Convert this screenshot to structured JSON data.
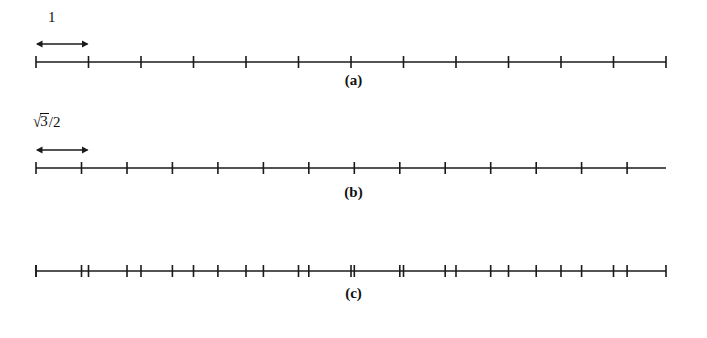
{
  "figure": {
    "background_color": "#ffffff",
    "ink_color": "#1a1a1a",
    "width": 707,
    "height": 338
  },
  "chart_data": {
    "type": "line",
    "title": "",
    "subtitle": "",
    "xlabel": "",
    "ylabel": "",
    "legend_position": "none",
    "grid": false,
    "panels": [
      {
        "caption": "(a)",
        "caption_x": 355,
        "caption_y": 80,
        "axis_y": 62,
        "axis_x_start": 36,
        "axis_x_end": 666,
        "spacing_px": 52.5,
        "spacing_value": 1,
        "spacing_label": "1",
        "tick_half_height": 6,
        "tick_positions": [
          36,
          88.5,
          141,
          193.5,
          246,
          298.5,
          351,
          403.5,
          456,
          508.5,
          561,
          613.5,
          666
        ],
        "tick_count": 13,
        "measure": {
          "label": "1",
          "label_x": 56,
          "label_y": 16,
          "arrow_y": 44,
          "arrow_x_start": 36,
          "arrow_x_end": 88.5
        }
      },
      {
        "caption": "(b)",
        "caption_x": 355,
        "caption_y": 192,
        "axis_y": 168,
        "axis_x_start": 36,
        "axis_x_end": 666,
        "spacing_px": 45.47,
        "spacing_value": 0.8660254,
        "spacing_label": "sqrt(3)/2",
        "tick_half_height": 6,
        "tick_positions": [
          36,
          81.5,
          127,
          172.4,
          217.9,
          263.4,
          308.8,
          354.3,
          399.8,
          445.2,
          490.7,
          536.2,
          581.6,
          627.1
        ],
        "tick_count": 14,
        "measure": {
          "label": "sqrt(3)/2",
          "label_radical_sign": "√",
          "label_radicand": "3",
          "label_divisor": "/2",
          "label_x": 36,
          "label_y": 118,
          "arrow_y": 150,
          "arrow_x_start": 36,
          "arrow_x_end": 88.5
        }
      },
      {
        "caption": "(c)",
        "caption_x": 355,
        "caption_y": 297,
        "axis_y": 271,
        "axis_x_start": 36,
        "axis_x_end": 666,
        "spacing_label": "superposition of (a) and (b)",
        "tick_half_height": 6,
        "tick_positions_a": [
          36,
          88.5,
          141,
          193.5,
          246,
          298.5,
          351,
          403.5,
          456,
          508.5,
          561,
          613.5,
          666
        ],
        "tick_positions_b": [
          36,
          81.5,
          127,
          172.4,
          217.9,
          263.4,
          308.8,
          354.3,
          399.8,
          445.2,
          490.7,
          536.2,
          581.6,
          627.1
        ],
        "tick_count": 27
      }
    ]
  },
  "captions": {
    "a": "(a)",
    "b": "(b)",
    "c": "(c)"
  },
  "measures": {
    "unit_one": "1",
    "unit_sqrt": {
      "radical_sign": "√",
      "radicand": "3",
      "divisor": "/2"
    }
  }
}
